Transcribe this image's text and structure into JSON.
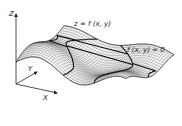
{
  "figure": {
    "surface_label": "z = f (x, y)",
    "contour_label": "f (x, y) = 0",
    "axes": {
      "z": "Z",
      "y": "Y",
      "x": "X"
    }
  },
  "colors": {
    "ink": "#222222",
    "mesh": "#555555",
    "background": "#ffffff"
  }
}
